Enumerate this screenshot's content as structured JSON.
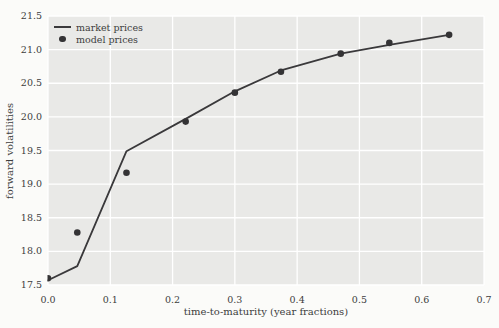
{
  "style": {
    "page_bg": "#fbfbf9",
    "plot_bg": "#e9e9e7",
    "grid_color": "#ffffff",
    "line_color": "#3a393b",
    "marker_color": "#343335",
    "text_color": "#3d3d3d"
  },
  "chart_data": {
    "type": "line",
    "title": "",
    "xlabel": "time-to-maturity (year fractions)",
    "ylabel": "forward volatilities",
    "xlim": [
      0.0,
      0.7
    ],
    "ylim": [
      17.5,
      21.5
    ],
    "grid": true,
    "legend_position": "upper-left",
    "x_tick_values": [
      0.0,
      0.1,
      0.2,
      0.3,
      0.4,
      0.5,
      0.6,
      0.7
    ],
    "x_tick_labels": [
      "0.0",
      "0.1",
      "0.2",
      "0.3",
      "0.4",
      "0.5",
      "0.6",
      "0.7"
    ],
    "y_tick_values": [
      17.5,
      18.0,
      18.5,
      19.0,
      19.5,
      20.0,
      20.5,
      21.0,
      21.5
    ],
    "y_tick_labels": [
      "17.5",
      "18.0",
      "18.5",
      "19.0",
      "19.5",
      "20.0",
      "20.5",
      "21.0",
      "21.5"
    ],
    "series": [
      {
        "name": "market prices",
        "type": "line",
        "x": [
          0.0,
          0.047,
          0.126,
          0.221,
          0.3,
          0.374,
          0.47,
          0.548,
          0.644
        ],
        "y": [
          17.57,
          17.78,
          19.49,
          19.97,
          20.38,
          20.69,
          20.94,
          21.07,
          21.22
        ]
      },
      {
        "name": "model prices",
        "type": "scatter",
        "x": [
          0.0,
          0.047,
          0.126,
          0.221,
          0.3,
          0.374,
          0.47,
          0.548,
          0.644
        ],
        "y": [
          17.6,
          18.28,
          19.17,
          19.93,
          20.36,
          20.67,
          20.94,
          21.1,
          21.22
        ]
      }
    ]
  }
}
